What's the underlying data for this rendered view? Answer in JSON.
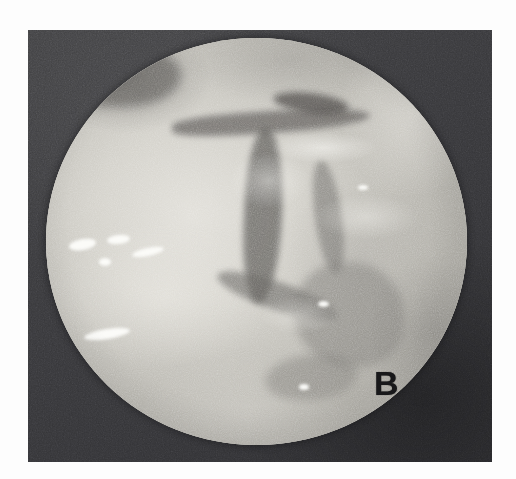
{
  "figure": {
    "kind": "arthroscopic-photograph",
    "panel_label": "B",
    "modality": "endoscopic circular field of view",
    "colors": {
      "page_background": "#fdfdfd",
      "frame_dark": "#37373a",
      "field_midtone": "#cfcdc6",
      "field_highlight": "#f2f0ea",
      "field_shadow": "#5e5c5a",
      "label_text": "#18181a"
    },
    "geometry": {
      "frame": {
        "x": 28,
        "y": 30,
        "width": 464,
        "height": 432
      },
      "scope_circle": {
        "center_x": 256,
        "center_y": 241,
        "diameter": 421
      },
      "label_position": {
        "x": 346,
        "y": 336
      }
    }
  }
}
